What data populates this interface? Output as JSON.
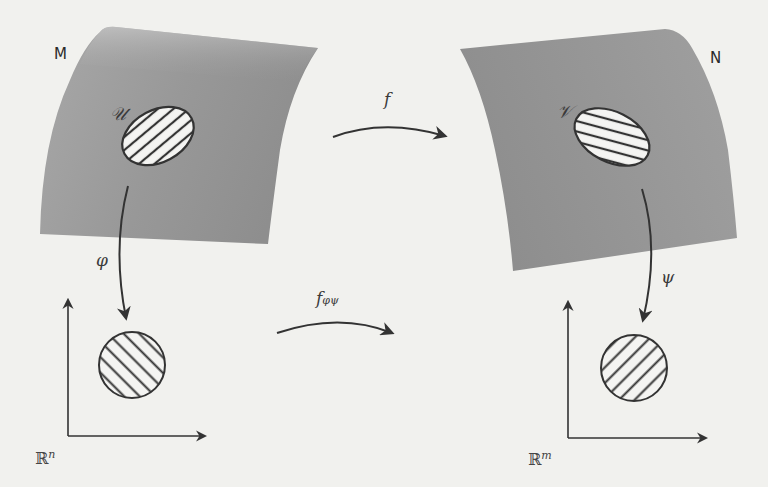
{
  "diagram": {
    "type": "manifold-chart-diagram",
    "colors": {
      "background": "#f1f1ee",
      "surface": "#9c9c9c",
      "surface_highlight": "#c4c4c4",
      "stroke": "#333333",
      "region_fill": "#f4f4f2"
    },
    "manifolds": [
      {
        "id": "M",
        "label": "M",
        "region_label": "𝒰",
        "region_pattern": "horizontal-hatch"
      },
      {
        "id": "N",
        "label": "N",
        "region_label": "𝒱",
        "region_pattern": "horizontal-hatch"
      }
    ],
    "euclidean_spaces": [
      {
        "id": "Rn",
        "label_base": "ℝ",
        "label_exp": "n",
        "disk_pattern": "diagonal-hatch-down"
      },
      {
        "id": "Rm",
        "label_base": "ℝ",
        "label_exp": "m",
        "disk_pattern": "diagonal-hatch-up"
      }
    ],
    "maps": {
      "f": {
        "label": "f",
        "from": "M",
        "to": "N"
      },
      "phi": {
        "label": "φ",
        "from": "M",
        "to": "Rn"
      },
      "psi": {
        "label": "ψ",
        "from": "N",
        "to": "Rm"
      },
      "f_phi_psi": {
        "label_base": "f",
        "label_sub": "φψ",
        "from": "Rn",
        "to": "Rm"
      }
    }
  }
}
